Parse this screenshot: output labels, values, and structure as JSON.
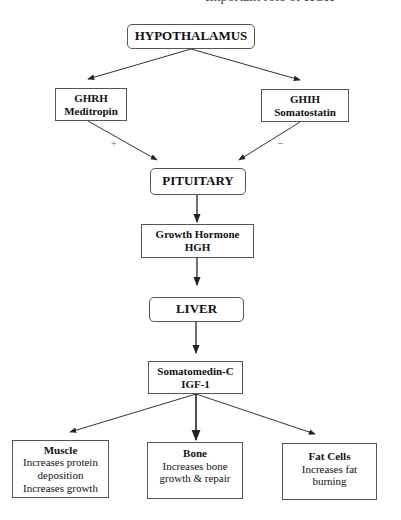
{
  "header": {
    "clipped_caption": "Important role of HGH"
  },
  "nodes": {
    "hypothalamus": {
      "title": "HYPOTHALAMUS"
    },
    "ghrh": {
      "line1": "GHRH",
      "line2": "Meditropin"
    },
    "ghih": {
      "line1": "GHIH",
      "line2": "Somatostatin"
    },
    "pituitary": {
      "title": "PITUITARY"
    },
    "growth_hormone": {
      "line1": "Growth Hormone",
      "line2": "HGH"
    },
    "liver": {
      "title": "LIVER"
    },
    "somatomedin": {
      "line1": "Somatomedin-C",
      "line2": "IGF-1"
    },
    "muscle": {
      "title": "Muscle",
      "lines": [
        "Increases protein",
        "deposition",
        "Increases growth"
      ]
    },
    "bone": {
      "title": "Bone",
      "lines": [
        "Increases bone",
        "growth & repair"
      ]
    },
    "fat": {
      "title": "Fat Cells",
      "lines": [
        "Increases fat",
        "burning"
      ]
    }
  },
  "edges": [
    {
      "from": "hypothalamus",
      "to": "ghrh",
      "label": ""
    },
    {
      "from": "hypothalamus",
      "to": "ghih",
      "label": ""
    },
    {
      "from": "ghrh",
      "to": "pituitary",
      "label": "+"
    },
    {
      "from": "ghih",
      "to": "pituitary",
      "label": "–"
    },
    {
      "from": "pituitary",
      "to": "growth_hormone",
      "label": ""
    },
    {
      "from": "growth_hormone",
      "to": "liver",
      "label": ""
    },
    {
      "from": "liver",
      "to": "somatomedin",
      "label": ""
    },
    {
      "from": "somatomedin",
      "to": "muscle",
      "label": ""
    },
    {
      "from": "somatomedin",
      "to": "bone",
      "label": ""
    },
    {
      "from": "somatomedin",
      "to": "fat",
      "label": ""
    }
  ],
  "colors": {
    "line": "#333333",
    "border": "#555555",
    "background": "#ffffff"
  }
}
